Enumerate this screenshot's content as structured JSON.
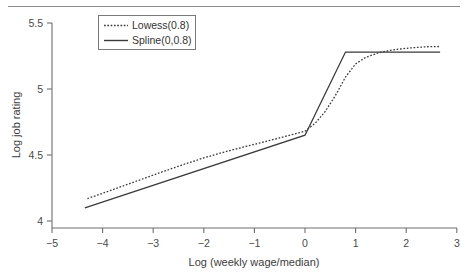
{
  "chart_data": {
    "type": "line",
    "title": "",
    "subtitle": "",
    "xlabel": "Log (weekly wage/median)",
    "ylabel": "Log job rating",
    "xlim": [
      -5,
      3
    ],
    "ylim": [
      4,
      5.5
    ],
    "xticks": [
      "−5",
      "−4",
      "−3",
      "−2",
      "−1",
      "0",
      "1",
      "2",
      "3"
    ],
    "xtick_values": [
      -5,
      -4,
      -3,
      -2,
      -1,
      0,
      1,
      2,
      3
    ],
    "yticks": [
      "4",
      "4.5",
      "5",
      "5.5"
    ],
    "ytick_values": [
      4,
      4.5,
      5,
      5.5
    ],
    "grid": false,
    "legend_position": "top-left",
    "legend_entries": [
      "Lowess(0.8)",
      "Spline(0,0.8)"
    ],
    "series": [
      {
        "name": "Lowess(0.8)",
        "style": "dotted",
        "x": [
          -4.3,
          -4.0,
          -3.6,
          -3.2,
          -2.8,
          -2.4,
          -2.0,
          -1.6,
          -1.2,
          -0.8,
          -0.4,
          0.0,
          0.2,
          0.4,
          0.6,
          0.8,
          1.0,
          1.2,
          1.5,
          1.8,
          2.1,
          2.4,
          2.67
        ],
        "y": [
          4.17,
          4.21,
          4.265,
          4.32,
          4.375,
          4.428,
          4.478,
          4.522,
          4.562,
          4.6,
          4.64,
          4.68,
          4.74,
          4.83,
          4.95,
          5.09,
          5.19,
          5.24,
          5.28,
          5.3,
          5.312,
          5.32,
          5.322
        ]
      },
      {
        "name": "Spline(0,0.8)",
        "style": "solid",
        "x": [
          -4.35,
          0.0,
          0.8,
          2.67
        ],
        "y": [
          4.1,
          4.65,
          5.28,
          5.28
        ]
      }
    ],
    "annotations": [
      {
        "text": "knot at x = 0",
        "x": 0,
        "y": 4.65
      },
      {
        "text": "knot at x = 0.8",
        "x": 0.8,
        "y": 5.28
      }
    ]
  },
  "figure": {
    "top_rule": "horizontal-rule"
  }
}
